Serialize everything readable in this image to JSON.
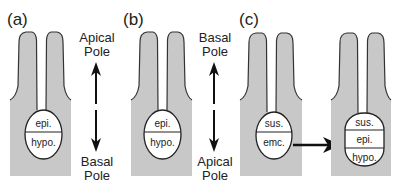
{
  "figure": {
    "panels": [
      {
        "label": "(a)",
        "embryo": {
          "top_cell": "epi.",
          "bottom_cell": "hypo."
        },
        "axis": {
          "top_label_line1": "Apical",
          "top_label_line2": "Pole",
          "bottom_label_line1": "Basal",
          "bottom_label_line2": "Pole"
        }
      },
      {
        "label": "(b)",
        "embryo": {
          "top_cell": "epi.",
          "bottom_cell": "hypo."
        },
        "axis": {
          "top_label_line1": "Basal",
          "top_label_line2": "Pole",
          "bottom_label_line1": "Apical",
          "bottom_label_line2": "Pole"
        }
      },
      {
        "label": "(c)",
        "before": {
          "top_cell": "sus.",
          "bottom_cell": "emc."
        },
        "after": {
          "top_cell": "sus.",
          "middle_cell": "epi.",
          "bottom_cell": "hypo."
        }
      }
    ],
    "colors": {
      "tissue": "#c8c8c8",
      "outline": "#333333",
      "arrow": "#111111",
      "background": "#ffffff"
    }
  }
}
